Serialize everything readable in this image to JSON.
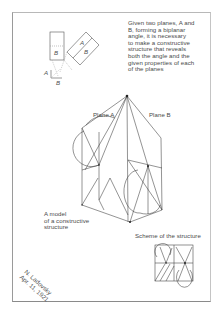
{
  "intro_text": {
    "lines": [
      "Given two planes, A and",
      "B, forming a biplanar",
      "angle, it is necessary",
      "to make a constructive",
      "structure that reveals",
      "both the angle and the",
      "given properties of each",
      "of the planes"
    ]
  },
  "diagram_labels": {
    "small_A1": "A",
    "small_B1": "B",
    "small_A2": "A",
    "small_B2": "B",
    "small_A3": "A",
    "small_B3": "B"
  },
  "model": {
    "plane_a_label": "Plane A",
    "plane_b_label": "Plane B",
    "caption_lines": [
      "A model",
      "of a constructive",
      "structure"
    ]
  },
  "scheme": {
    "caption": "Scheme of the structure"
  },
  "signature": {
    "lines": [
      "N. Ladovsky",
      "Apr. 11, 1921"
    ]
  },
  "colors": {
    "ink": "#3a3a3a",
    "paper": "#ffffff",
    "frame": "#9a9a9a"
  }
}
